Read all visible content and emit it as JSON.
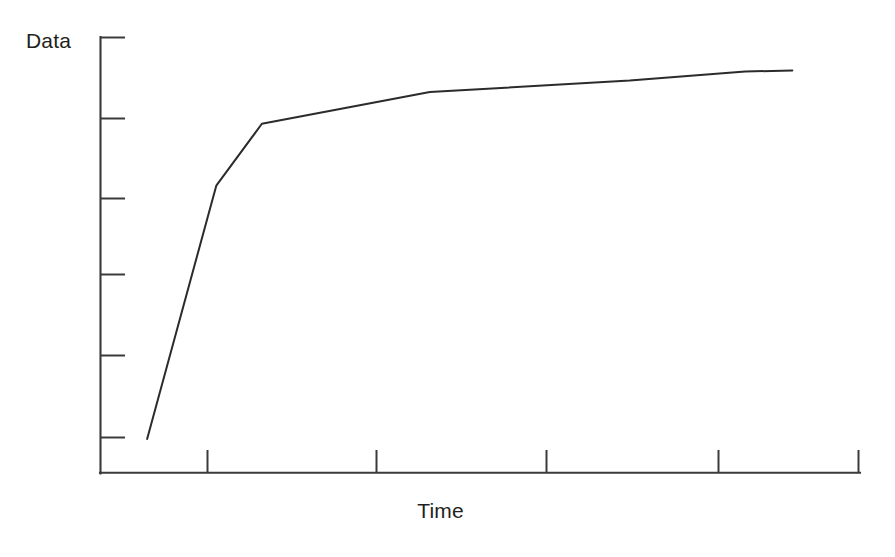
{
  "chart_data": {
    "type": "line",
    "title": "",
    "subtitle": "",
    "xlabel": "Time",
    "ylabel": "Data",
    "grid": false,
    "legend": false,
    "legend_position": "none",
    "axis_style": "open-box with inward tick marks, no tick labels",
    "xlim": [
      0,
      1
    ],
    "ylim": [
      0,
      1
    ],
    "x_tick_labels": [],
    "y_tick_labels": [],
    "x_tick_count": 4,
    "y_tick_count": 6,
    "x": [
      0.062,
      0.153,
      0.213,
      0.434,
      0.697,
      0.849,
      0.911
    ],
    "y": [
      0.078,
      0.659,
      0.801,
      0.874,
      0.9,
      0.921,
      0.923
    ],
    "series": [
      {
        "name": "Data",
        "color": "#2b2b2b",
        "x": [
          0.062,
          0.153,
          0.213,
          0.434,
          0.697,
          0.849,
          0.911
        ],
        "y": [
          0.078,
          0.659,
          0.801,
          0.874,
          0.9,
          0.921,
          0.923
        ]
      }
    ],
    "points_px": "147,439 216,186 262,124 430,92 630,81 745,72 792,71",
    "annotations": []
  },
  "figure": {
    "background_color": "#ffffff",
    "line_color": "#2b2b2b",
    "axis_color": "#3a3a3a",
    "text_color": "#231f20"
  },
  "axes": {
    "y_axis": {
      "label": "Data",
      "x_px": 100,
      "top_px": 37,
      "bottom_px": 473,
      "ticks_px": [
        37,
        118,
        198,
        274,
        355,
        437
      ]
    },
    "x_axis": {
      "label": "Time",
      "y_px": 473,
      "left_px": 100,
      "right_px": 860,
      "ticks_px": [
        207,
        376,
        546,
        718,
        860
      ]
    }
  }
}
